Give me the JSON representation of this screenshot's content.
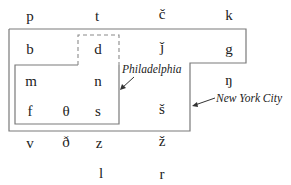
{
  "diagram": {
    "title": "",
    "consonants": {
      "row1": [
        "p",
        "t",
        "č",
        "k"
      ],
      "row2": [
        "b",
        "d",
        "ǰ",
        "g"
      ],
      "row3": [
        "m",
        "n",
        "ŋ"
      ],
      "row4": [
        "f",
        "θ",
        "s",
        "š"
      ],
      "row5": [
        "v",
        "ð",
        "z",
        "ž"
      ],
      "row6": [
        "l",
        "r"
      ]
    },
    "labels": {
      "philadelphia": "Philadelphia",
      "new_york_city": "New York City"
    },
    "colors": {
      "line": "#7a7a7a",
      "text": "#222222",
      "background": "#ffffff"
    }
  }
}
